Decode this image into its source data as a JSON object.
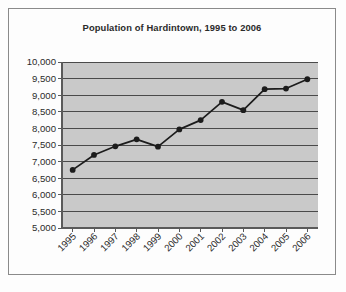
{
  "figure": {
    "border_color": "#8a8a8a",
    "page_background": "#fdfdfd",
    "plot_background": "#c9c9c9",
    "gridline_color": "#4a4a4a",
    "series_color": "#1c1c1c"
  },
  "chart_data": {
    "type": "line",
    "title": "Population of Hardintown, 1995 to 2006",
    "xlabel": "",
    "ylabel": "",
    "categories": [
      "1995",
      "1996",
      "1997",
      "1998",
      "1999",
      "2000",
      "2001",
      "2002",
      "2003",
      "2004",
      "2005",
      "2006"
    ],
    "values": [
      6750,
      7200,
      7460,
      7670,
      7450,
      7970,
      8250,
      8800,
      8550,
      9180,
      9200,
      9480
    ],
    "ylim": [
      5000,
      10000
    ],
    "ytick_labels": [
      "5,000",
      "5,500",
      "6,000",
      "6,500",
      "7,000",
      "7,500",
      "8,000",
      "8,500",
      "9,000",
      "9,500",
      "10,000"
    ],
    "ytick_values": [
      5000,
      5500,
      6000,
      6500,
      7000,
      7500,
      8000,
      8500,
      9000,
      9500,
      10000
    ],
    "xtick_labels": [
      "1995",
      "1996",
      "1997",
      "1998",
      "1999",
      "2000",
      "2001",
      "2002",
      "2003",
      "2004",
      "2005",
      "2006"
    ],
    "xtick_rotation": 45,
    "grid": true,
    "grid_axis": "y",
    "legend": false,
    "legend_position": "none",
    "markers": "filled-circle",
    "series": [
      {
        "name": "Population",
        "values": [
          6750,
          7200,
          7460,
          7670,
          7450,
          7970,
          8250,
          8800,
          8550,
          9180,
          9200,
          9480
        ]
      }
    ]
  }
}
